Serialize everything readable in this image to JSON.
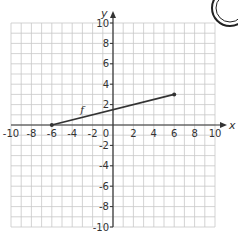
{
  "chart_data": {
    "type": "line",
    "title": "",
    "xlabel": "x",
    "ylabel": "y",
    "xlim": [
      -10,
      10
    ],
    "ylim": [
      -10,
      10
    ],
    "grid": true,
    "grid_step": 1,
    "x_tick_labels": [
      "-10",
      "-8",
      "-6",
      "-4",
      "-2",
      "0",
      "2",
      "4",
      "6",
      "8",
      "10"
    ],
    "y_tick_labels": [
      "10",
      "8",
      "6",
      "4",
      "2",
      "-2",
      "-4",
      "-6",
      "-8",
      "-10"
    ],
    "series": [
      {
        "name": "f",
        "points": [
          [
            -6,
            0
          ],
          [
            6,
            3
          ]
        ],
        "endpoints": "closed",
        "color": "#333333"
      }
    ],
    "annotations": [
      {
        "text": "f",
        "x": -3.2,
        "y": 1.2
      }
    ]
  },
  "colors": {
    "grid": "#c8c8c8",
    "axis": "#333333",
    "text": "#333333",
    "background": "#ffffff"
  }
}
